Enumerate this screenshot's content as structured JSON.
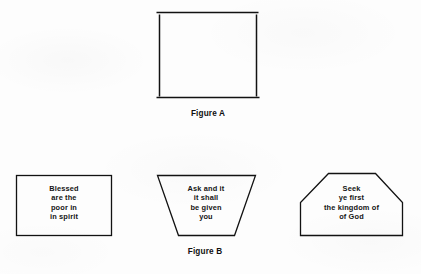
{
  "page": {
    "background_color": "#fdfdfd",
    "stroke_color": "#111111",
    "text_color": "#141414"
  },
  "figure_a": {
    "caption": "Figure A",
    "shape": "open-square-outline",
    "text_lines": []
  },
  "figure_b": {
    "caption": "Figure B",
    "shapes": [
      {
        "name": "rectangle",
        "text_lines": [
          "Blessed",
          "are the",
          "poor in",
          "in spirit"
        ]
      },
      {
        "name": "inverted-trapezoid",
        "text_lines": [
          "Ask and it",
          "it shall",
          "be given",
          "you"
        ]
      },
      {
        "name": "clipped-corner-pentagon",
        "text_lines": [
          "Seek",
          "ye first",
          "the kingdom of",
          "of God"
        ]
      }
    ]
  }
}
